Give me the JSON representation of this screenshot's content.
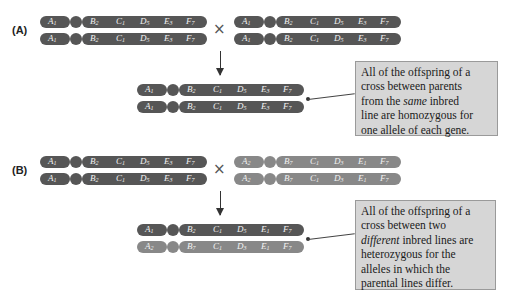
{
  "panels": [
    {
      "label": "(A)",
      "cross_symbol": "×",
      "parent1": {
        "shade": "dark",
        "chromosomes": [
          [
            "A1",
            "B2",
            "C1",
            "D5",
            "E3",
            "F7"
          ],
          [
            "A1",
            "B2",
            "C1",
            "D5",
            "E3",
            "F7"
          ]
        ]
      },
      "parent2": {
        "shade": "dark",
        "chromosomes": [
          [
            "A1",
            "B2",
            "C1",
            "D5",
            "E3",
            "F7"
          ],
          [
            "A1",
            "B2",
            "C1",
            "D5",
            "E3",
            "F7"
          ]
        ]
      },
      "offspring": {
        "chromosomes": [
          {
            "shade": "dark",
            "genes": [
              "A1",
              "B2",
              "C1",
              "D5",
              "E3",
              "F7"
            ]
          },
          {
            "shade": "dark",
            "genes": [
              "A1",
              "B2",
              "C1",
              "D5",
              "E3",
              "F7"
            ]
          }
        ]
      },
      "callout": {
        "line1": "All of the offspring of a",
        "line2": "cross between parents",
        "line3_pre": "from the ",
        "line3_em": "same",
        "line3_post": " inbred",
        "line4": "line are homozygous for",
        "line5": "one allele of each gene."
      }
    },
    {
      "label": "(B)",
      "cross_symbol": "×",
      "parent1": {
        "shade": "dark",
        "chromosomes": [
          [
            "A1",
            "B2",
            "C1",
            "D5",
            "E3",
            "F7"
          ],
          [
            "A1",
            "B2",
            "C1",
            "D5",
            "E3",
            "F7"
          ]
        ]
      },
      "parent2": {
        "shade": "light",
        "chromosomes": [
          [
            "A2",
            "B7",
            "C1",
            "D3",
            "E1",
            "F7"
          ],
          [
            "A2",
            "B7",
            "C1",
            "D3",
            "E1",
            "F7"
          ]
        ]
      },
      "offspring": {
        "chromosomes": [
          {
            "shade": "dark",
            "genes": [
              "A1",
              "B2",
              "C1",
              "D5",
              "E1",
              "F7"
            ]
          },
          {
            "shade": "light",
            "genes": [
              "A2",
              "B7",
              "C1",
              "D3",
              "E1",
              "F7"
            ]
          }
        ]
      },
      "callout": {
        "line1": "All of the offspring of a",
        "line2": "cross between two",
        "line3_em": "different",
        "line3_post": " inbred lines are",
        "line4": "heterozygous for the",
        "line5": "alleles in which the",
        "line6": "parental lines differ."
      }
    }
  ],
  "colors": {
    "chromosome_dark": "#565656",
    "chromosome_light": "#888888",
    "callout_bg": "#d6d6d6",
    "callout_border": "#9a9a9a"
  }
}
